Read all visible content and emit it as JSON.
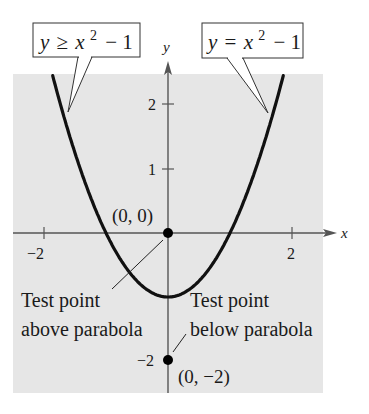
{
  "chart_data": {
    "type": "line",
    "title": "",
    "xlabel": "x",
    "ylabel": "y",
    "xlim": [
      -2.5,
      2.5
    ],
    "ylim": [
      -2.5,
      2.6
    ],
    "grid": false,
    "shaded_region": "y >= x^2 - 1 (entire plot region shaded)",
    "series": [
      {
        "name": "y = x^2 - 1",
        "function": "x^2 - 1",
        "x": [
          -1.85,
          -1.5,
          -1,
          -0.5,
          0,
          0.5,
          1,
          1.5,
          1.85
        ],
        "y": [
          2.42,
          1.25,
          0,
          -0.75,
          -1,
          -0.75,
          0,
          1.25,
          2.42
        ]
      }
    ],
    "points": [
      {
        "x": 0,
        "y": 0,
        "label": "(0, 0)",
        "note": "Test point above parabola"
      },
      {
        "x": 0,
        "y": -2,
        "label": "(0, -2)",
        "note": "Test point below parabola"
      }
    ],
    "x_ticks": [
      -2,
      2
    ],
    "y_ticks": [
      -2,
      1,
      2
    ],
    "annotations": [
      "y ≥ x² − 1",
      "y = x² − 1",
      "Test point above parabola",
      "Test point below parabola"
    ]
  },
  "labels": {
    "callout_left_y": "y",
    "callout_left_rel": "≥",
    "callout_left_x": "x",
    "callout_left_exp": "2",
    "callout_left_tail": "− 1",
    "callout_right_y": "y",
    "callout_right_rel": "=",
    "callout_right_x": "x",
    "callout_right_exp": "2",
    "callout_right_tail": "− 1",
    "axis_x": "x",
    "axis_y": "y",
    "tick_x_neg2": "−2",
    "tick_x_2": "2",
    "tick_y_1": "1",
    "tick_y_2": "2",
    "tick_y_neg2": "−2",
    "point_origin": "(0, 0)",
    "point_below": "(0, −2)",
    "above_line1": "Test point",
    "above_line2": "above parabola",
    "below_line1": "Test point",
    "below_line2": "below parabola"
  },
  "colors": {
    "shade": "#e6e6e6",
    "curve": "#111111",
    "axis": "#555555"
  }
}
